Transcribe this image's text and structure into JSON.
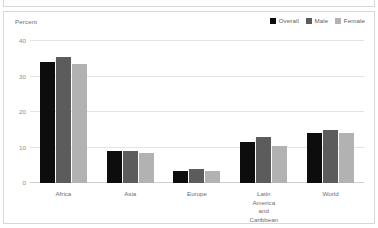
{
  "panel": {
    "axis_title": "Percent"
  },
  "legend": {
    "position": "top-right",
    "items": [
      {
        "label": "Overall",
        "color": "#0d0d0d"
      },
      {
        "label": "Male",
        "color": "#5c5c5c"
      },
      {
        "label": "Female",
        "color": "#b2b2b2"
      }
    ]
  },
  "chart_data": {
    "type": "bar",
    "title": "",
    "xlabel": "",
    "ylabel": "Percent",
    "ylim": [
      0,
      40
    ],
    "yticks": [
      0,
      10,
      20,
      30,
      40
    ],
    "ytick_labels": [
      "0",
      "10",
      "20",
      "30",
      "40"
    ],
    "grid": true,
    "legend_position": "top-right",
    "categories": [
      "Africa",
      "Asia",
      "Europe",
      "Latin America\nand Caribbean",
      "World"
    ],
    "series": [
      {
        "name": "Overall",
        "color": "#0d0d0d",
        "values": [
          34.0,
          9.0,
          3.5,
          11.5,
          14.0
        ]
      },
      {
        "name": "Male",
        "color": "#5c5c5c",
        "values": [
          35.5,
          9.0,
          4.0,
          13.0,
          15.0
        ]
      },
      {
        "name": "Female",
        "color": "#b2b2b2",
        "values": [
          33.5,
          8.5,
          3.5,
          10.5,
          14.0
        ]
      }
    ]
  }
}
